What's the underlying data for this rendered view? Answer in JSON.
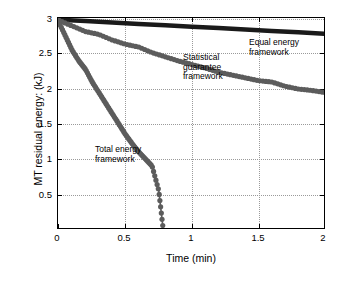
{
  "chart_data": {
    "type": "line",
    "title": "",
    "xlabel": "Time (min)",
    "ylabel": "MT residual energy: (kJ)",
    "xlim": [
      0,
      2
    ],
    "ylim": [
      0,
      3
    ],
    "xticks": [
      0,
      0.5,
      1,
      1.5,
      2
    ],
    "xticklabels": [
      "0",
      "0.5",
      "1",
      "1.5",
      "2"
    ],
    "yticks": [
      0.5,
      1,
      1.5,
      2,
      2.5,
      3
    ],
    "yticklabels": [
      "0.5",
      "1",
      "1.5",
      "2",
      "2.5",
      "3"
    ],
    "grid": true,
    "legend_position": "inline-annotations",
    "series": [
      {
        "name": "Equal energy framework",
        "color": "#1a1a1a",
        "marker": "line",
        "x": [
          0,
          0.2,
          0.4,
          0.6,
          0.8,
          1.0,
          1.2,
          1.4,
          1.6,
          1.8,
          2.0
        ],
        "values": [
          2.99,
          2.97,
          2.95,
          2.93,
          2.91,
          2.89,
          2.87,
          2.85,
          2.83,
          2.81,
          2.79
        ]
      },
      {
        "name": "Statistical guarantee framework",
        "color": "#5c5c5c",
        "marker": "circle",
        "x": [
          0,
          0.1,
          0.2,
          0.3,
          0.4,
          0.5,
          0.6,
          0.7,
          0.8,
          0.9,
          1.0,
          1.1,
          1.2,
          1.3,
          1.4,
          1.5,
          1.6,
          1.7,
          1.8,
          1.9,
          2.0
        ],
        "values": [
          2.98,
          2.9,
          2.82,
          2.78,
          2.7,
          2.64,
          2.6,
          2.52,
          2.46,
          2.4,
          2.35,
          2.3,
          2.24,
          2.2,
          2.16,
          2.12,
          2.1,
          2.04,
          2.0,
          1.98,
          1.95
        ]
      },
      {
        "name": "Total energy framework",
        "color": "#5c5c5c",
        "marker": "circle",
        "x": [
          0,
          0.05,
          0.1,
          0.15,
          0.2,
          0.25,
          0.3,
          0.35,
          0.4,
          0.45,
          0.5,
          0.55,
          0.6,
          0.65,
          0.7,
          0.75,
          0.78
        ],
        "values": [
          2.95,
          2.75,
          2.55,
          2.4,
          2.28,
          2.1,
          1.95,
          1.8,
          1.65,
          1.5,
          1.35,
          1.22,
          1.1,
          1.0,
          0.9,
          0.55,
          0.05
        ]
      }
    ],
    "annotations": [
      {
        "text": "Equal energy\nframework",
        "x": 1.42,
        "y": 2.62
      },
      {
        "text": "Statistical\nguarantee\nframework",
        "x": 0.92,
        "y": 2.42
      },
      {
        "text": "Total energy\nframework",
        "x": 0.27,
        "y": 1.3
      }
    ]
  },
  "axis": {
    "xlabel": "Time (min)",
    "ylabel": "MT residual energy: (kJ)",
    "xticklabels": [
      "0",
      "0.5",
      "1",
      "1.5",
      "2"
    ],
    "yticklabels": [
      "0.5",
      "1",
      "1.5",
      "2",
      "2.5",
      "3"
    ]
  },
  "annotations": {
    "equal": "Equal energy\nframework",
    "statistical": "Statistical\nguarantee\nframework",
    "total": "Total energy\nframework"
  }
}
